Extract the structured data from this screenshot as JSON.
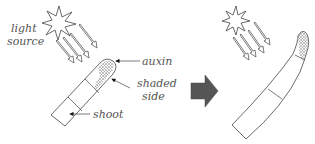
{
  "diagram": {
    "before": {
      "labels": {
        "light_line1": "light",
        "light_line2": "source",
        "auxin": "auxin",
        "shaded_line1": "shaded",
        "shaded_line2": "side",
        "shoot": "shoot"
      },
      "light_arrow_count": 4,
      "shoot_segments": 3
    },
    "transition": {
      "arrow": "right-arrow",
      "color": "#555555"
    },
    "after": {
      "light_arrow_count": 4,
      "shoot_shape": "curved-toward-light",
      "shoot_segments": 3
    },
    "colors": {
      "line": "#444444",
      "text": "#555555",
      "auxin_stipple": "#666666",
      "background": "#ffffff"
    }
  }
}
